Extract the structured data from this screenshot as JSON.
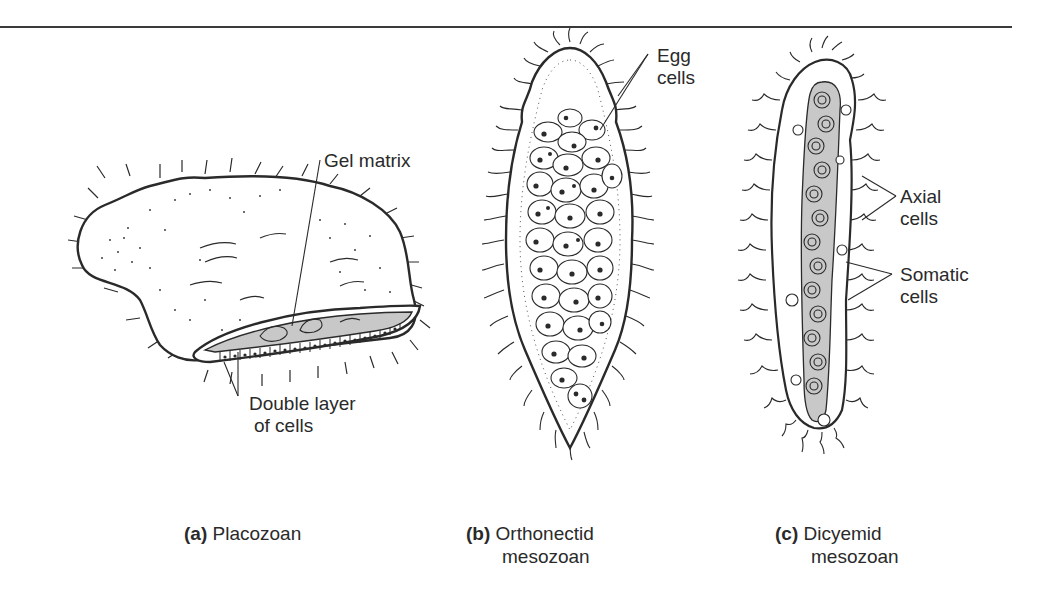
{
  "figure": {
    "panels": [
      {
        "letter": "(a)",
        "name": "Placozoan",
        "name_line2": "",
        "labels": [
          {
            "text": "Gel matrix"
          },
          {
            "text_line1": "Double layer",
            "text_line2": "of cells"
          }
        ]
      },
      {
        "letter": "(b)",
        "name": "Orthonectid",
        "name_line2": "mesozoan",
        "labels": [
          {
            "text_line1": "Egg",
            "text_line2": "cells"
          }
        ]
      },
      {
        "letter": "(c)",
        "name": "Dicyemid",
        "name_line2": "mesozoan",
        "labels": [
          {
            "text_line1": "Axial",
            "text_line2": "cells"
          },
          {
            "text_line1": "Somatic",
            "text_line2": "cells"
          }
        ]
      }
    ],
    "colors": {
      "ink": "#2a2a2a",
      "shade": "#c8c8c8",
      "background": "#ffffff"
    }
  }
}
